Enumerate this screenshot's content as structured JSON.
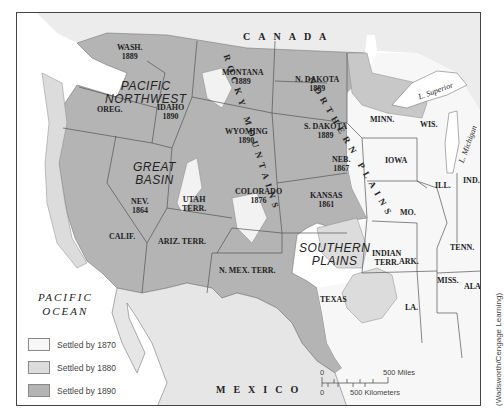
{
  "map": {
    "colors": {
      "settled_1870": "#f7f7f7",
      "settled_1880": "#dcdcdc",
      "settled_1890": "#b4b4b4",
      "border": "#555555",
      "water": "#ffffff"
    },
    "countries": {
      "canada": "CANADA",
      "mexico": "MEXICO",
      "ocean": "PACIFIC\nOCEAN"
    },
    "regions": {
      "pacific_northwest": "PACIFIC\nNORTHWEST",
      "great_basin": "GREAT\nBASIN",
      "rocky_mountains": "ROCKY MOUNTAINS",
      "northern_plains": "NORTHERN PLAINS",
      "southern_plains": "SOUTHERN\nPLAINS"
    },
    "lakes": {
      "superior": "L. Superior",
      "michigan": "L. Michigan"
    },
    "states": [
      {
        "name": "WASH.",
        "year": "1889"
      },
      {
        "name": "OREG.",
        "year": ""
      },
      {
        "name": "IDAHO",
        "year": "1890"
      },
      {
        "name": "MONTANA",
        "year": "1889"
      },
      {
        "name": "WYOMING",
        "year": "1890"
      },
      {
        "name": "N. DAKOTA",
        "year": "1889"
      },
      {
        "name": "S. DAKOTA",
        "year": "1889"
      },
      {
        "name": "NEB.",
        "year": "1867"
      },
      {
        "name": "KANSAS",
        "year": "1861"
      },
      {
        "name": "COLORADO",
        "year": "1876"
      },
      {
        "name": "NEV.",
        "year": "1864"
      },
      {
        "name": "UTAH",
        "year": "TERR."
      },
      {
        "name": "CALIF.",
        "year": ""
      },
      {
        "name": "ARIZ. TERR.",
        "year": ""
      },
      {
        "name": "N. MEX. TERR.",
        "year": ""
      },
      {
        "name": "TEXAS",
        "year": ""
      },
      {
        "name": "INDIAN",
        "year": "TERR."
      },
      {
        "name": "MINN.",
        "year": ""
      },
      {
        "name": "WIS.",
        "year": ""
      },
      {
        "name": "IOWA",
        "year": ""
      },
      {
        "name": "ILL.",
        "year": ""
      },
      {
        "name": "IND.",
        "year": ""
      },
      {
        "name": "MO.",
        "year": ""
      },
      {
        "name": "ARK.",
        "year": ""
      },
      {
        "name": "TENN.",
        "year": ""
      },
      {
        "name": "LA.",
        "year": ""
      },
      {
        "name": "MISS.",
        "year": ""
      },
      {
        "name": "ALA.",
        "year": ""
      }
    ],
    "legend": [
      {
        "label": "Settled by 1870",
        "color": "#f7f7f7"
      },
      {
        "label": "Settled by 1880",
        "color": "#dcdcdc"
      },
      {
        "label": "Settled by 1890",
        "color": "#b4b4b4"
      }
    ],
    "scale": {
      "miles_zero": "0",
      "miles_label": "500 Miles",
      "km_zero": "0",
      "km_label": "500 Kilometers"
    },
    "credit": "(Wadsworth/Cengage Learning)"
  }
}
